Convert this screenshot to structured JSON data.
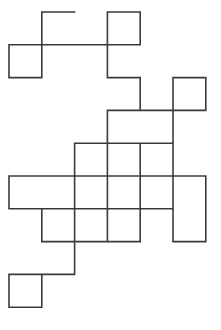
{
  "page": {
    "background_color": "#ffffff",
    "width": 221,
    "height": 330
  },
  "figure": {
    "name": "rectilinear-polyline-drawing",
    "stroke_color": "#3a3a3a",
    "stroke_width": 1.6,
    "fill": "none",
    "grid": {
      "origin_x": 9,
      "origin_y": 12,
      "cell_size": 32.8,
      "cols": 7,
      "rows": 10,
      "visible": false
    },
    "vertices_grid": [
      [
        2,
        0
      ],
      [
        1,
        0
      ],
      [
        1,
        1
      ],
      [
        0,
        1
      ],
      [
        0,
        2
      ],
      [
        1,
        2
      ],
      [
        1,
        1
      ],
      [
        3,
        1
      ],
      [
        3,
        0
      ],
      [
        4,
        0
      ],
      [
        4,
        1
      ],
      [
        3,
        1
      ],
      [
        3,
        2
      ],
      [
        4,
        2
      ],
      [
        4,
        3
      ],
      [
        6,
        3
      ],
      [
        6,
        2
      ],
      [
        5,
        2
      ],
      [
        5,
        4
      ],
      [
        3,
        4
      ],
      [
        3,
        3
      ],
      [
        5,
        3
      ],
      [
        5,
        5
      ],
      [
        4,
        5
      ],
      [
        4,
        4
      ],
      [
        4,
        7
      ],
      [
        3,
        7
      ],
      [
        3,
        4
      ],
      [
        2,
        4
      ],
      [
        2,
        6
      ],
      [
        3,
        6
      ],
      [
        3,
        7
      ],
      [
        1,
        7
      ],
      [
        1,
        6
      ],
      [
        2,
        6
      ],
      [
        2,
        5
      ],
      [
        5,
        5
      ],
      [
        5,
        7
      ],
      [
        6,
        7
      ],
      [
        6,
        5
      ],
      [
        5,
        5
      ],
      [
        5,
        6
      ],
      [
        2,
        6
      ],
      [
        2,
        5
      ],
      [
        0,
        5
      ],
      [
        0,
        6
      ],
      [
        2,
        6
      ],
      [
        2,
        8
      ],
      [
        0,
        8
      ],
      [
        0,
        9
      ],
      [
        1,
        9
      ],
      [
        1,
        8
      ]
    ],
    "segments_count": 51,
    "closed": false
  }
}
